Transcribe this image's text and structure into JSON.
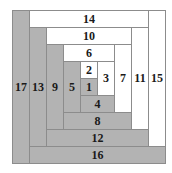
{
  "diagram": {
    "unit_px": 17,
    "grid_units": 9,
    "colors": {
      "gray": "#b3b3b3",
      "white": "#ffffff",
      "border": "#8c8c8c"
    },
    "strips": [
      {
        "label": "1",
        "x": 4,
        "y": 4,
        "w": 1,
        "h": 1,
        "fill": "gray"
      },
      {
        "label": "2",
        "x": 4,
        "y": 3,
        "w": 1,
        "h": 1,
        "fill": "white"
      },
      {
        "label": "3",
        "x": 5,
        "y": 3,
        "w": 1,
        "h": 2,
        "fill": "white"
      },
      {
        "label": "4",
        "x": 4,
        "y": 5,
        "w": 2,
        "h": 1,
        "fill": "gray"
      },
      {
        "label": "5",
        "x": 3,
        "y": 3,
        "w": 1,
        "h": 3,
        "fill": "gray"
      },
      {
        "label": "6",
        "x": 3,
        "y": 2,
        "w": 3,
        "h": 1,
        "fill": "white"
      },
      {
        "label": "7",
        "x": 6,
        "y": 2,
        "w": 1,
        "h": 4,
        "fill": "white"
      },
      {
        "label": "8",
        "x": 3,
        "y": 6,
        "w": 4,
        "h": 1,
        "fill": "gray"
      },
      {
        "label": "9",
        "x": 2,
        "y": 2,
        "w": 1,
        "h": 5,
        "fill": "gray"
      },
      {
        "label": "10",
        "x": 2,
        "y": 1,
        "w": 5,
        "h": 1,
        "fill": "white"
      },
      {
        "label": "11",
        "x": 7,
        "y": 1,
        "w": 1,
        "h": 6,
        "fill": "white"
      },
      {
        "label": "12",
        "x": 2,
        "y": 7,
        "w": 6,
        "h": 1,
        "fill": "gray"
      },
      {
        "label": "13",
        "x": 1,
        "y": 1,
        "w": 1,
        "h": 7,
        "fill": "gray"
      },
      {
        "label": "14",
        "x": 1,
        "y": 0,
        "w": 7,
        "h": 1,
        "fill": "white"
      },
      {
        "label": "15",
        "x": 8,
        "y": 0,
        "w": 1,
        "h": 8,
        "fill": "white"
      },
      {
        "label": "16",
        "x": 1,
        "y": 8,
        "w": 8,
        "h": 1,
        "fill": "gray"
      },
      {
        "label": "17",
        "x": 0,
        "y": 0,
        "w": 1,
        "h": 9,
        "fill": "gray"
      }
    ]
  }
}
